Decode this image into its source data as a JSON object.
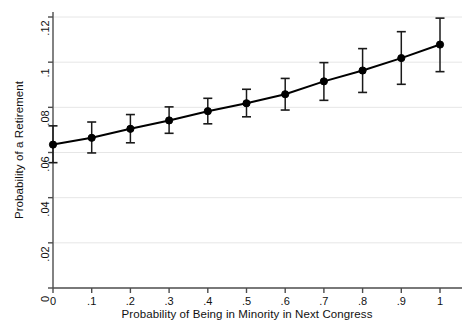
{
  "chart_data": {
    "type": "line",
    "title": "",
    "subtitle": "",
    "xlabel": "Probability of Being in Minority in Next Congress",
    "ylabel": "Probability of a Retirement",
    "xlim": [
      0,
      1
    ],
    "ylim": [
      0,
      0.12
    ],
    "grid": true,
    "grid_axis": "y",
    "legend": "none",
    "marker": "filled-circle",
    "error_bars": "vertical-capped",
    "x": [
      0,
      0.1,
      0.2,
      0.3,
      0.4,
      0.5,
      0.6,
      0.7,
      0.8,
      0.9,
      1
    ],
    "values": [
      0.0635,
      0.0665,
      0.0705,
      0.0742,
      0.0783,
      0.0818,
      0.0858,
      0.0915,
      0.0963,
      0.1018,
      0.1078
    ],
    "ci_lower": [
      0.0555,
      0.0598,
      0.0643,
      0.0685,
      0.0727,
      0.0758,
      0.0788,
      0.0831,
      0.0866,
      0.0902,
      0.0958
    ],
    "ci_upper": [
      0.0718,
      0.0735,
      0.0768,
      0.0802,
      0.084,
      0.088,
      0.0928,
      0.0998,
      0.106,
      0.1135,
      0.1195
    ],
    "series": [
      {
        "name": "Predicted probability of retirement",
        "values": [
          0.0635,
          0.0665,
          0.0705,
          0.0742,
          0.0783,
          0.0818,
          0.0858,
          0.0915,
          0.0963,
          0.1018,
          0.1078
        ]
      }
    ],
    "xticks": [
      0,
      0.1,
      0.2,
      0.3,
      0.4,
      0.5,
      0.6,
      0.7,
      0.8,
      0.9,
      1
    ],
    "xticklabels": [
      "0",
      ".1",
      ".2",
      ".3",
      ".4",
      ".5",
      ".6",
      ".7",
      ".8",
      ".9",
      "1"
    ],
    "yticks": [
      0,
      0.02,
      0.04,
      0.06,
      0.08,
      0.1,
      0.12
    ],
    "yticklabels": [
      "0",
      ".02",
      ".04",
      ".06",
      ".08",
      ".1",
      ".12"
    ],
    "colors": {
      "line": "#000000",
      "marker": "#000000",
      "error_bar": "#1a1a1a",
      "grid": "#e6e6e6",
      "axis": "#4d4d4d",
      "background": "#ffffff"
    }
  }
}
